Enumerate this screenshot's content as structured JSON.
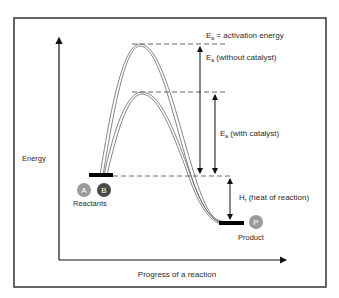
{
  "diagram": {
    "axes": {
      "y_label": "Energy",
      "x_label": "Progress of a reaction"
    },
    "legend": {
      "symbol": "E",
      "subscript": "a",
      "definition": " = activation energy"
    },
    "annotations": {
      "ea_without": {
        "symbol": "E",
        "subscript": "a",
        "text": " (without catalyst)"
      },
      "ea_with": {
        "symbol": "E",
        "subscript": "a",
        "text": " (with catalyst)"
      },
      "heat": {
        "symbol": "H",
        "subscript": "r",
        "text": " (heat of reaction)"
      }
    },
    "reactants": {
      "label": "Reactants",
      "molecules": [
        {
          "letter": "A",
          "color": "#9a9a9a"
        },
        {
          "letter": "B",
          "color": "#4a4a4a"
        }
      ]
    },
    "product": {
      "label": "Product",
      "molecule": {
        "letter": "P",
        "color": "#9a9a9a"
      }
    },
    "colors": {
      "frame": "#333333",
      "curve": "#555555",
      "dash": "#666666",
      "level_bar": "#000000"
    }
  }
}
